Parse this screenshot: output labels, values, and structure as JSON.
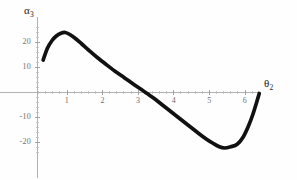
{
  "chart_data": {
    "type": "line",
    "title": "",
    "subtitle": "",
    "xlabel": "θ₂",
    "ylabel": "α₃",
    "xlabel_symbol": "θ",
    "xlabel_subscript": "2",
    "ylabel_symbol": "α",
    "ylabel_subscript": "3",
    "xlim": [
      0.16,
      6.45
    ],
    "ylim": [
      -25.5,
      27.0
    ],
    "xticks": [
      1,
      2,
      3,
      4,
      5,
      6
    ],
    "xticklabels": [
      "1",
      "2",
      "3",
      "4",
      "5",
      "6"
    ],
    "yticks": [
      20,
      10,
      -10,
      -20
    ],
    "yticklabels": [
      "20",
      "10",
      "-10",
      "-20"
    ],
    "grid": false,
    "legend": null,
    "legend_position": "none",
    "axis_color": "#a8a8a8",
    "curve_color": "#111111",
    "background_color": "#fefefe",
    "series": [
      {
        "name": "alpha3",
        "x": [
          0.33,
          0.45,
          0.58,
          0.7,
          0.83,
          0.95,
          1.08,
          1.22,
          1.4,
          1.62,
          1.85,
          2.1,
          2.35,
          2.6,
          2.85,
          3.1,
          3.25,
          3.45,
          3.7,
          3.95,
          4.2,
          4.45,
          4.7,
          4.92,
          5.1,
          5.28,
          5.42,
          5.6,
          5.78,
          5.95,
          6.1,
          6.22,
          6.33,
          6.4
        ],
        "y": [
          12.8,
          17.5,
          20.6,
          22.4,
          23.5,
          23.8,
          23.0,
          21.6,
          19.4,
          16.6,
          13.8,
          11.0,
          8.3,
          5.8,
          3.3,
          0.9,
          -0.6,
          -2.6,
          -5.4,
          -8.2,
          -11.0,
          -13.8,
          -16.6,
          -18.9,
          -20.5,
          -21.9,
          -22.4,
          -21.9,
          -20.9,
          -18.0,
          -13.5,
          -9.0,
          -4.0,
          -0.6
        ]
      }
    ],
    "annotations": {
      "peak": {
        "x": 0.95,
        "y": 23.8
      },
      "minimum": {
        "x": 5.42,
        "y": -22.4
      },
      "zero_crossing": {
        "x": 3.25,
        "y": 0
      }
    }
  }
}
